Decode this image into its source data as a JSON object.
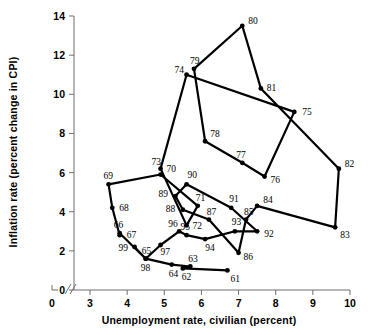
{
  "chart_data": {
    "type": "line",
    "title": "",
    "xlabel": "Unemployment rate, civilian (percent)",
    "ylabel": "Inflation rate (percent change in CPI)",
    "xlim": [
      3,
      10
    ],
    "ylim": [
      0,
      14
    ],
    "xticks": [
      0,
      3,
      4,
      5,
      6,
      7,
      8,
      9,
      10
    ],
    "yticks": [
      0,
      2,
      4,
      6,
      8,
      10,
      12,
      14
    ],
    "axis_break": true,
    "grid": false,
    "legend": null,
    "series": [
      {
        "name": "Phillips curve path",
        "connected": true,
        "points": [
          {
            "label": "61",
            "x": 6.7,
            "y": 1.0
          },
          {
            "label": "62",
            "x": 5.5,
            "y": 1.1
          },
          {
            "label": "63",
            "x": 5.7,
            "y": 1.2
          },
          {
            "label": "64",
            "x": 5.2,
            "y": 1.3
          },
          {
            "label": "65",
            "x": 4.5,
            "y": 1.6
          },
          {
            "label": "66",
            "x": 3.8,
            "y": 2.9
          },
          {
            "label": "67",
            "x": 3.8,
            "y": 2.8
          },
          {
            "label": "68",
            "x": 3.6,
            "y": 4.2
          },
          {
            "label": "69",
            "x": 3.5,
            "y": 5.4
          },
          {
            "label": "70",
            "x": 4.9,
            "y": 5.9
          },
          {
            "label": "71",
            "x": 5.9,
            "y": 4.3
          },
          {
            "label": "72",
            "x": 5.6,
            "y": 3.3
          },
          {
            "label": "73",
            "x": 4.9,
            "y": 6.2
          },
          {
            "label": "74",
            "x": 5.6,
            "y": 11.0
          },
          {
            "label": "75",
            "x": 8.5,
            "y": 9.1
          },
          {
            "label": "76",
            "x": 7.7,
            "y": 5.8
          },
          {
            "label": "77",
            "x": 7.1,
            "y": 6.5
          },
          {
            "label": "78",
            "x": 6.1,
            "y": 7.6
          },
          {
            "label": "79",
            "x": 5.8,
            "y": 11.3
          },
          {
            "label": "80",
            "x": 7.1,
            "y": 13.5
          },
          {
            "label": "81",
            "x": 7.6,
            "y": 10.3
          },
          {
            "label": "82",
            "x": 9.7,
            "y": 6.2
          },
          {
            "label": "83",
            "x": 9.6,
            "y": 3.2
          },
          {
            "label": "84",
            "x": 7.5,
            "y": 4.3
          },
          {
            "label": "85",
            "x": 7.2,
            "y": 3.6
          },
          {
            "label": "86",
            "x": 7.0,
            "y": 1.9
          },
          {
            "label": "87",
            "x": 6.2,
            "y": 3.6
          },
          {
            "label": "88",
            "x": 5.5,
            "y": 4.1
          },
          {
            "label": "89",
            "x": 5.3,
            "y": 4.8
          },
          {
            "label": "90",
            "x": 5.6,
            "y": 5.4
          },
          {
            "label": "91",
            "x": 6.8,
            "y": 4.2
          },
          {
            "label": "92",
            "x": 7.5,
            "y": 3.0
          },
          {
            "label": "93",
            "x": 6.9,
            "y": 3.0
          },
          {
            "label": "94",
            "x": 6.1,
            "y": 2.6
          },
          {
            "label": "95",
            "x": 5.6,
            "y": 2.8
          },
          {
            "label": "96",
            "x": 5.4,
            "y": 3.0
          },
          {
            "label": "97",
            "x": 4.9,
            "y": 2.3
          },
          {
            "label": "98",
            "x": 4.5,
            "y": 1.6
          },
          {
            "label": "99",
            "x": 4.2,
            "y": 2.2
          }
        ]
      }
    ]
  },
  "axes": {
    "x_title": "Unemployment rate, civilian (percent)",
    "y_title": "Inflation rate (percent change in CPI)",
    "x_tick_labels": [
      "0",
      "3",
      "4",
      "5",
      "6",
      "7",
      "8",
      "9",
      "10"
    ],
    "y_tick_labels": [
      "0",
      "2",
      "4",
      "6",
      "8",
      "10",
      "12",
      "14"
    ]
  },
  "style": {
    "line_color": "#000000",
    "marker_color": "#000000",
    "axis_color": "#6f6f6f",
    "background": "#ffffff"
  }
}
